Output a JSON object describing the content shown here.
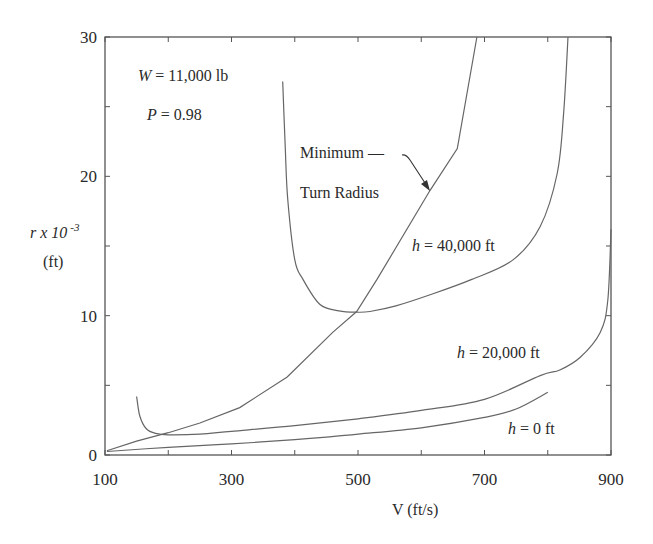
{
  "chart_data": {
    "type": "line",
    "title": "",
    "xlabel": "V (ft/s)",
    "ylabel_main": "r x ",
    "ylabel_exp_base": "10",
    "ylabel_exp": "-3",
    "ylabel_unit": "(ft)",
    "xlim": [
      100,
      900
    ],
    "ylim": [
      0,
      30
    ],
    "x_ticks": [
      100,
      200,
      300,
      400,
      500,
      600,
      700,
      800,
      900
    ],
    "x_tick_labels": [
      "100",
      "300",
      "500",
      "700",
      "900"
    ],
    "x_tick_label_values": [
      100,
      300,
      500,
      700,
      900
    ],
    "y_ticks": [
      0,
      5,
      10,
      15,
      20,
      25,
      30
    ],
    "y_tick_labels": [
      "0",
      "10",
      "20",
      "30"
    ],
    "y_tick_label_values": [
      0,
      10,
      20,
      30
    ],
    "grid": false,
    "annotations": {
      "weight": "W = 11,000 lb",
      "weight_var": "W",
      "weight_rest": " = 11,000 lb",
      "power": "P = 0.98",
      "power_var": "P",
      "power_rest": " = 0.98",
      "min_turn_line1": "Minimum —",
      "min_turn_line2": "Turn Radius"
    },
    "series": [
      {
        "name": "h = 0 ft",
        "label_var": "h",
        "label_rest": " = 0 ft",
        "x": [
          103,
          200,
          300,
          400,
          455,
          500,
          600,
          700,
          750,
          800
        ],
        "y": [
          0.25,
          0.55,
          0.8,
          1.1,
          1.3,
          1.5,
          1.95,
          2.7,
          3.3,
          4.5
        ]
      },
      {
        "name": "h = 20,000 ft",
        "label_var": "h",
        "label_rest": " = 20,000 ft",
        "x": [
          150,
          155,
          165,
          180,
          200,
          250,
          300,
          400,
          500,
          600,
          700,
          788,
          819,
          851,
          883,
          895,
          900
        ],
        "y": [
          4.2,
          2.8,
          1.9,
          1.55,
          1.45,
          1.5,
          1.7,
          2.1,
          2.6,
          3.2,
          4.0,
          5.7,
          6.1,
          7.0,
          8.8,
          11.1,
          16.2
        ]
      },
      {
        "name": "h = 40,000 ft",
        "label_var": "h",
        "label_rest": " = 40,000 ft",
        "x": [
          381,
          385,
          389,
          400,
          413,
          440,
          470,
          498,
          519,
          560,
          614,
          680,
          745,
          788,
          815,
          825,
          832
        ],
        "y": [
          26.8,
          22.0,
          18.3,
          14.0,
          12.6,
          10.8,
          10.35,
          10.25,
          10.3,
          10.7,
          11.5,
          12.6,
          14.0,
          16.4,
          20.2,
          24.5,
          30.0
        ]
      },
      {
        "name": "Minimum Turn Radius",
        "x": [
          103,
          150,
          200,
          250,
          313,
          388,
          460,
          498,
          530,
          614,
          657,
          688
        ],
        "y": [
          0.3,
          1.0,
          1.6,
          2.3,
          3.4,
          5.6,
          8.8,
          10.3,
          12.6,
          19.0,
          22.0,
          30.0
        ]
      }
    ]
  }
}
